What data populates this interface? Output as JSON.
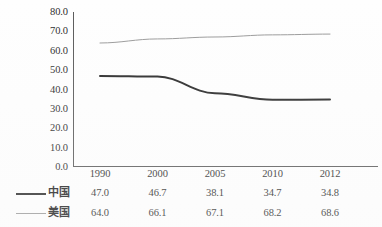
{
  "chart_data": {
    "type": "line",
    "title": "",
    "subtitle": "",
    "xlabel": "",
    "ylabel": "",
    "categories": [
      "1990",
      "2000",
      "2005",
      "2010",
      "2012"
    ],
    "series": [
      {
        "name": "中国",
        "values": [
          47.0,
          46.7,
          38.1,
          34.7,
          34.8
        ],
        "color": "#2a2a2a",
        "line_width": 2,
        "style": "solid"
      },
      {
        "name": "美国",
        "values": [
          64.0,
          66.1,
          67.1,
          68.2,
          68.6
        ],
        "color": "#9a9a9a",
        "line_width": 1,
        "style": "solid"
      }
    ],
    "ylim": [
      0.0,
      80.0
    ],
    "ytick_step": 10.0,
    "ytick_labels": [
      "80.0",
      "70.0",
      "60.0",
      "50.0",
      "40.0",
      "30.0",
      "20.0",
      "10.0",
      "0.0"
    ],
    "ytick_values": [
      80.0,
      70.0,
      60.0,
      50.0,
      40.0,
      30.0,
      20.0,
      10.0,
      0.0
    ],
    "grid": false,
    "legend_position": "bottom-left",
    "value_table": [
      {
        "label": "中国",
        "cells": [
          "47.0",
          "46.7",
          "38.1",
          "34.7",
          "34.8"
        ]
      },
      {
        "label": "美国",
        "cells": [
          "64.0",
          "66.1",
          "67.1",
          "68.2",
          "68.6"
        ]
      }
    ]
  }
}
